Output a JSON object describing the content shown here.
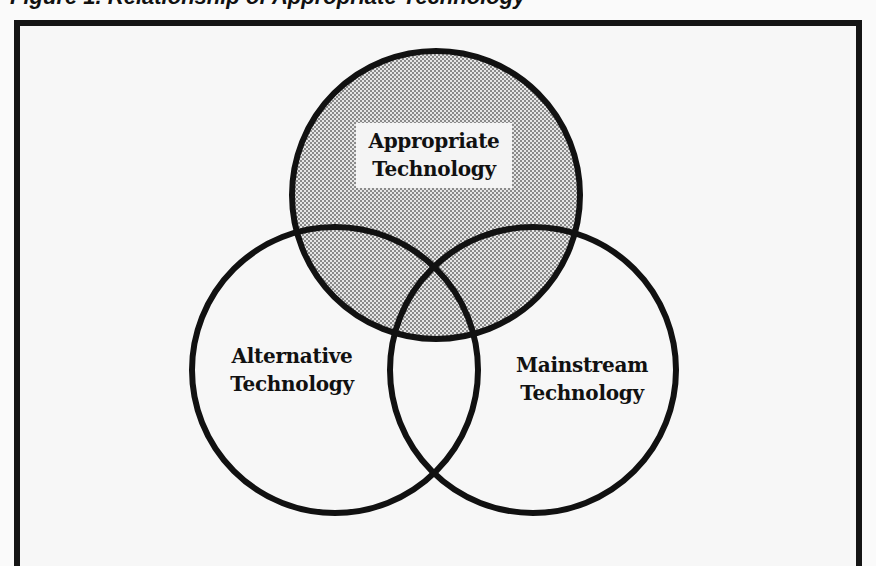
{
  "figure": {
    "caption": "Figure 1. Relationship of Appropriate Technology",
    "caption_visible": "partially cut off at top edge"
  },
  "venn": {
    "circles": [
      {
        "id": "appropriate",
        "label_line1": "Appropriate",
        "label_line2": "Technology",
        "shaded": true,
        "cx": 436,
        "cy": 195,
        "r": 144
      },
      {
        "id": "alternative",
        "label_line1": "Alternative",
        "label_line2": "Technology",
        "shaded": false,
        "cx": 335,
        "cy": 370,
        "r": 143
      },
      {
        "id": "mainstream",
        "label_line1": "Mainstream",
        "label_line2": "Technology",
        "shaded": false,
        "cx": 533,
        "cy": 370,
        "r": 143
      }
    ],
    "colors": {
      "stroke": "#111111",
      "shade_dark": "#8a8a8a",
      "shade_light": "#e6e6e6",
      "background": "#f7f7f7",
      "frame": "#151515"
    }
  }
}
